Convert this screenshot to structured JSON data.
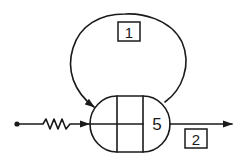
{
  "diagram": {
    "colors": {
      "stroke": "#1a1a1a",
      "background": "#ffffff"
    },
    "node": {
      "label": "5",
      "shape": "capsule",
      "segments": 3,
      "left_segments_split_horizontally": true
    },
    "loop": {
      "label": "1",
      "direction": "from node top-right around top back into node top-left"
    },
    "input": {
      "terminal": "dot",
      "element": "zigzag-spring",
      "arrow": "into node left side"
    },
    "output": {
      "label": "2",
      "arrow": "exits node right side"
    }
  }
}
